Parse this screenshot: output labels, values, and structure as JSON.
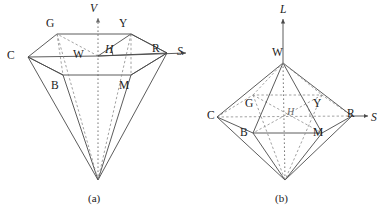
{
  "figure": {
    "background_color": "#ffffff",
    "line_color": "#4a4a4a",
    "dash_color": "#8a8a8a",
    "text_color": "#1a1a1a",
    "width": 391,
    "height": 214
  },
  "panels": [
    {
      "id": "a",
      "caption": "(a)",
      "caption_pos": {
        "x": 88,
        "y": 192
      },
      "shape": "hexcone",
      "axes": [
        {
          "name": "vertical-axis",
          "label": "V",
          "label_pos": {
            "x": 90,
            "y": 3
          },
          "style": "dotted"
        },
        {
          "name": "saturation-axis",
          "label": "S",
          "label_pos": {
            "x": 177,
            "y": 46
          },
          "style": "solid"
        }
      ],
      "vertices": [
        {
          "label": "G",
          "pos": {
            "x": 46,
            "y": 18
          }
        },
        {
          "label": "Y",
          "pos": {
            "x": 119,
            "y": 18
          }
        },
        {
          "label": "C",
          "pos": {
            "x": 7,
            "y": 50
          }
        },
        {
          "label": "R",
          "pos": {
            "x": 152,
            "y": 43
          }
        },
        {
          "label": "W",
          "pos": {
            "x": 73,
            "y": 49
          }
        },
        {
          "label": "H",
          "pos": {
            "x": 105,
            "y": 44
          },
          "italic": true
        },
        {
          "label": "B",
          "pos": {
            "x": 51,
            "y": 80
          }
        },
        {
          "label": "M",
          "pos": {
            "x": 119,
            "y": 80
          }
        }
      ]
    },
    {
      "id": "b",
      "caption": "(b)",
      "caption_pos": {
        "x": 275,
        "y": 192
      },
      "shape": "double-hexcone",
      "axes": [
        {
          "name": "lightness-axis",
          "label": "L",
          "label_pos": {
            "x": 280,
            "y": 4
          },
          "style": "solid"
        },
        {
          "name": "saturation-axis",
          "label": "S",
          "label_pos": {
            "x": 371,
            "y": 112
          },
          "style": "solid"
        }
      ],
      "vertices": [
        {
          "label": "W",
          "pos": {
            "x": 272,
            "y": 47
          }
        },
        {
          "label": "G",
          "pos": {
            "x": 245,
            "y": 98
          }
        },
        {
          "label": "Y",
          "pos": {
            "x": 313,
            "y": 98
          }
        },
        {
          "label": "C",
          "pos": {
            "x": 207,
            "y": 110
          }
        },
        {
          "label": "R",
          "pos": {
            "x": 347,
            "y": 108
          }
        },
        {
          "label": "H",
          "pos": {
            "x": 287,
            "y": 107
          },
          "italic": true
        },
        {
          "label": "B",
          "pos": {
            "x": 240,
            "y": 127
          }
        },
        {
          "label": "M",
          "pos": {
            "x": 313,
            "y": 127
          }
        }
      ]
    }
  ],
  "geometry": {
    "panel_a": {
      "W": [
        98,
        56
      ],
      "C": [
        28,
        57
      ],
      "G": [
        57,
        34
      ],
      "Y": [
        131,
        34
      ],
      "R": [
        167,
        53
      ],
      "B": [
        63,
        75
      ],
      "M": [
        131,
        75
      ],
      "apex": [
        98,
        180
      ],
      "v_axis_top": [
        98,
        16
      ],
      "s_axis_end": [
        186,
        53
      ],
      "H": [
        121,
        42
      ]
    },
    "panel_b": {
      "W": [
        283,
        63
      ],
      "C": [
        217,
        117
      ],
      "G": [
        253,
        95
      ],
      "Y": [
        322,
        95
      ],
      "R": [
        352,
        116
      ],
      "B": [
        253,
        133
      ],
      "M": [
        322,
        133
      ],
      "apex": [
        285,
        180
      ],
      "center": [
        285,
        116
      ],
      "l_axis_top": [
        283,
        19
      ],
      "s_axis_end": [
        368,
        116
      ],
      "H": [
        298,
        112
      ]
    }
  },
  "caption_labels": {
    "a": "(a)",
    "b": "(b)"
  }
}
